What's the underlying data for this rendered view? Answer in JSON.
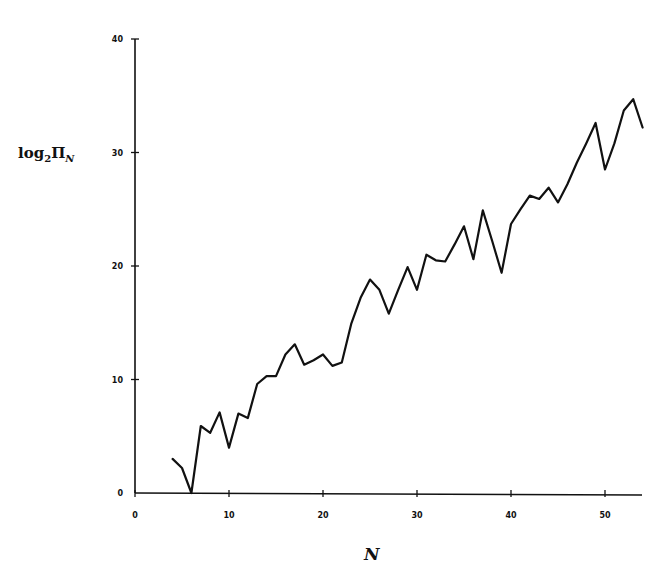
{
  "chart_data": {
    "type": "line",
    "title": "",
    "xlabel": "N",
    "ylabel": "log2 Π_N",
    "ylabel_parts": {
      "base": "log",
      "sub1": "2",
      "symbol": "Π",
      "sub2": "N"
    },
    "xlim": [
      0,
      54
    ],
    "ylim": [
      0,
      40
    ],
    "xticks": [
      0,
      10,
      20,
      30,
      40,
      50
    ],
    "yticks": [
      0,
      10,
      20,
      30,
      40
    ],
    "grid": false,
    "legend": null,
    "series": [
      {
        "name": "log2 Π_N",
        "color": "#111111",
        "x": [
          4,
          5,
          6,
          7,
          8,
          9,
          10,
          11,
          12,
          13,
          14,
          15,
          16,
          17,
          18,
          19,
          20,
          21,
          22,
          23,
          24,
          25,
          26,
          27,
          28,
          29,
          30,
          31,
          32,
          33,
          34,
          35,
          36,
          37,
          38,
          39,
          40,
          41,
          42,
          43,
          44,
          45,
          46,
          47,
          48,
          49,
          50,
          51,
          52,
          53,
          54
        ],
        "y": [
          3.0,
          2.2,
          0.0,
          5.9,
          5.3,
          7.1,
          4.0,
          7.0,
          6.6,
          9.6,
          10.3,
          10.3,
          12.2,
          13.1,
          11.3,
          11.7,
          12.2,
          11.2,
          11.5,
          14.9,
          17.2,
          18.8,
          17.9,
          15.8,
          17.9,
          19.9,
          17.9,
          21.0,
          20.5,
          20.4,
          21.9,
          23.5,
          20.6,
          24.9,
          22.2,
          19.4,
          23.7,
          25.0,
          26.2,
          25.9,
          26.9,
          25.6,
          27.2,
          29.1,
          30.8,
          32.6,
          28.5,
          30.8,
          33.7,
          34.7,
          32.2
        ]
      }
    ]
  },
  "labels": {
    "ylabel_base": "log",
    "ylabel_sub1": "2",
    "ylabel_symbol": "Π",
    "ylabel_sub2": "N",
    "xlabel": "N"
  }
}
